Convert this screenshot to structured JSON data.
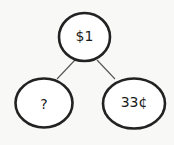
{
  "diagram": {
    "type": "tree",
    "nodes": [
      {
        "id": "root",
        "label": "$1"
      },
      {
        "id": "left",
        "label": "?"
      },
      {
        "id": "right",
        "label": "33¢"
      }
    ],
    "edges": [
      {
        "from": "root",
        "to": "left"
      },
      {
        "from": "root",
        "to": "right"
      }
    ]
  }
}
